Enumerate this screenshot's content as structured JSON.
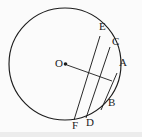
{
  "figure": {
    "background_color": "#fbfbfb",
    "stroke_color": "#1c1c1c",
    "label_color": "#1c1c1c",
    "band_color": "#ececec",
    "circle": {
      "center_label": "O",
      "center_x": 65,
      "center_y": 64,
      "radius": 56,
      "center_dot_radius": 1.8
    },
    "labels": {
      "center": "O",
      "a": "A",
      "b": "B",
      "c": "C",
      "d": "D",
      "e": "E",
      "f": "F"
    },
    "points": [
      {
        "name": "A",
        "x": 117,
        "y": 73,
        "label_x": 119,
        "label_y": 62
      },
      {
        "name": "B",
        "x": 101,
        "y": 110,
        "label_x": 108,
        "label_y": 102
      },
      {
        "name": "C",
        "x": 110,
        "y": 47,
        "label_x": 112,
        "label_y": 40
      },
      {
        "name": "D",
        "x": 86,
        "y": 118,
        "label_x": 87,
        "label_y": 118
      },
      {
        "name": "E",
        "x": 100,
        "y": 36,
        "label_x": 99,
        "label_y": 24
      },
      {
        "name": "F",
        "x": 74,
        "y": 120,
        "label_x": 73,
        "label_y": 121
      }
    ],
    "chords": [
      {
        "name": "chord-EF",
        "x1": 100,
        "y1": 36,
        "x2": 74,
        "y2": 120
      },
      {
        "name": "chord-CD",
        "x1": 110,
        "y1": 47,
        "x2": 86,
        "y2": 118
      },
      {
        "name": "chord-AB",
        "x1": 117,
        "y1": 73,
        "x2": 101,
        "y2": 110
      }
    ],
    "radius_segment": {
      "name": "segment-O-to-chords",
      "x1": 67,
      "y1": 65,
      "x2": 112,
      "y2": 81
    }
  }
}
